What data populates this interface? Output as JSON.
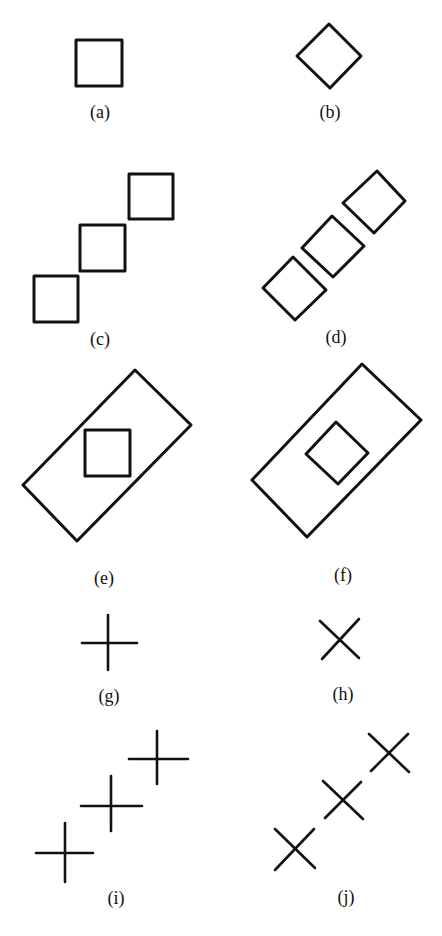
{
  "figure": {
    "panels": [
      {
        "id": "a",
        "label": "(a)",
        "description": "single upright square"
      },
      {
        "id": "b",
        "label": "(b)",
        "description": "single square rotated 45 degrees (diamond)"
      },
      {
        "id": "c",
        "label": "(c)",
        "description": "three upright squares in a diagonal row"
      },
      {
        "id": "d",
        "label": "(d)",
        "description": "three rotated squares in a diagonal row"
      },
      {
        "id": "e",
        "label": "(e)",
        "description": "upright square inside a tilted rectangle"
      },
      {
        "id": "f",
        "label": "(f)",
        "description": "diamond inside a tilted rectangle"
      },
      {
        "id": "g",
        "label": "(g)",
        "description": "single upright plus sign"
      },
      {
        "id": "h",
        "label": "(h)",
        "description": "single rotated cross (X)"
      },
      {
        "id": "i",
        "label": "(i)",
        "description": "three plus signs in a diagonal row"
      },
      {
        "id": "j",
        "label": "(j)",
        "description": "three X crosses in a diagonal row"
      }
    ],
    "stroke_color": "#111111",
    "background": "#ffffff"
  }
}
